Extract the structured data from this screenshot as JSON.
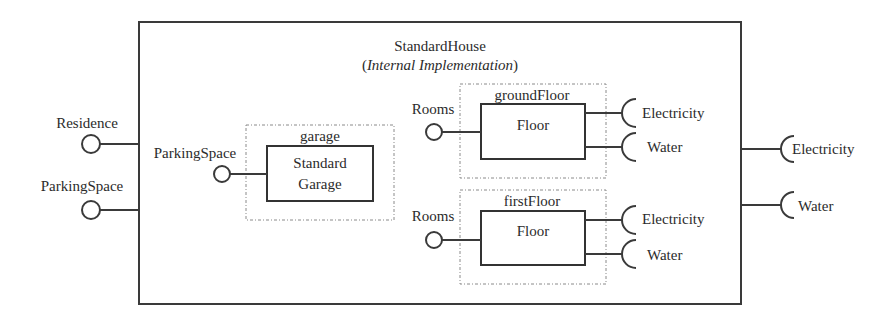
{
  "diagram": {
    "component": {
      "name": "StandardHouse",
      "subtitle_open": "(",
      "subtitle_italic": "Internal Implementation",
      "subtitle_close": ")"
    },
    "external_provided": [
      {
        "label": "Residence"
      },
      {
        "label": "ParkingSpace"
      }
    ],
    "external_required": [
      {
        "label": "Electricity"
      },
      {
        "label": "Water"
      }
    ],
    "parts": [
      {
        "role": "garage",
        "type_line1": "Standard",
        "type_line2": "Garage",
        "provided": "ParkingSpace",
        "required": []
      },
      {
        "role": "groundFloor",
        "type": "Floor",
        "provided": "Rooms",
        "required": [
          "Electricity",
          "Water"
        ]
      },
      {
        "role": "firstFloor",
        "type": "Floor",
        "provided": "Rooms",
        "required": [
          "Electricity",
          "Water"
        ]
      }
    ],
    "colors": {
      "stroke": "#333333",
      "dotted": "#8a8a8a",
      "text": "#2b2b2b",
      "background": "#ffffff"
    }
  }
}
